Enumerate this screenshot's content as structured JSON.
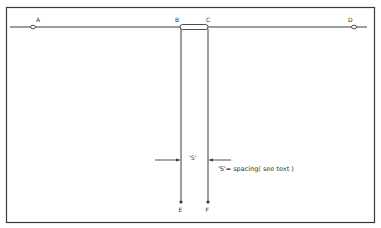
{
  "diagram": {
    "type": "antenna-wire-layout",
    "colors": {
      "line": "#3a3a3a",
      "background": "#ffffff"
    },
    "points": {
      "A": {
        "label": "A"
      },
      "B": {
        "label": "B"
      },
      "C": {
        "label": "C"
      },
      "D": {
        "label": "D"
      },
      "E": {
        "label": "E"
      },
      "F": {
        "label": "F"
      }
    },
    "spacing_marker": "'S'",
    "spacing_note": "'S'= spacing( see text )"
  }
}
